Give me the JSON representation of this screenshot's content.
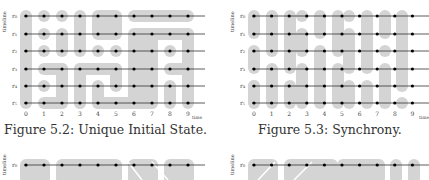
{
  "figures": [
    {
      "id": "fig-5-2",
      "caption": "Figure 5.2: Unique Initial State.",
      "ylabel": "timeline",
      "xlabel": "time",
      "rows": [
        "r0",
        "r1",
        "r2",
        "r3",
        "r4",
        "r5"
      ],
      "row_labels": [
        "r₀",
        "r₁",
        "r₂",
        "r₃",
        "r₄",
        "r₅"
      ],
      "cols": [
        "0",
        "1",
        "2",
        "3",
        "4",
        "5",
        "6",
        "7",
        "8",
        "9"
      ]
    },
    {
      "id": "fig-5-3",
      "caption": "Figure 5.3: Synchrony.",
      "ylabel": "timeline",
      "xlabel": "time",
      "rows": [
        "r0",
        "r1",
        "r2",
        "r3",
        "r4",
        "r5"
      ],
      "row_labels": [
        "r₀",
        "r₁",
        "r₂",
        "r₃",
        "r₄",
        "r₅"
      ],
      "cols": [
        "0",
        "1",
        "2",
        "3",
        "4",
        "5",
        "6",
        "7",
        "8",
        "9"
      ]
    },
    {
      "id": "fig-5-4-partial",
      "ylabel": "timeline",
      "row_labels": [
        "r₀"
      ]
    },
    {
      "id": "fig-5-5-partial",
      "ylabel": "timeline",
      "row_labels": [
        "r₀"
      ]
    }
  ],
  "colors": {
    "region": "#d4d4d4",
    "line": "#333333",
    "dot": "#000000",
    "text": "#333333"
  }
}
